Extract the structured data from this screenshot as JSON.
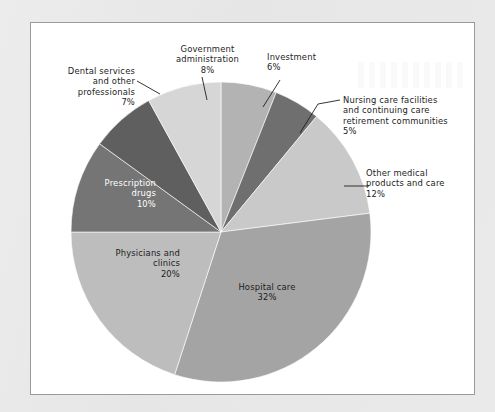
{
  "figure": {
    "panel_background": "#ffffff",
    "panel_border_color": "#9a9a9a",
    "page_background": "#e9e9e9"
  },
  "chart_data": {
    "type": "pie",
    "title": "",
    "subtitle": "",
    "xlabel": "",
    "ylabel": "",
    "legend_position": "none",
    "grid": false,
    "units": "percent",
    "start_angle_deg": 0,
    "direction": "clockwise",
    "center": {
      "x": 221,
      "y": 232
    },
    "radius": 150,
    "categories": [
      "Investment",
      "Nursing care facilities and continuing care retirement communities",
      "Other medical products and care",
      "Hospital care",
      "Physicians and clinics",
      "Prescription drugs",
      "Dental services and other professionals",
      "Government administration"
    ],
    "values": [
      6,
      5,
      12,
      32,
      20,
      10,
      7,
      8
    ],
    "slices": [
      {
        "label": "Investment",
        "value": 6,
        "value_text": "6%",
        "color": "#b3b3b3",
        "label_placement": "outside",
        "label_text": "Investment\n6%"
      },
      {
        "label": "Nursing care facilities and continuing care retirement communities",
        "value": 5,
        "value_text": "5%",
        "color": "#6f6f6f",
        "label_placement": "outside",
        "label_text": "Nursing care facilities\nand continuing care\nretirement communities\n5%"
      },
      {
        "label": "Other medical products and care",
        "value": 12,
        "value_text": "12%",
        "color": "#c9c9c9",
        "label_placement": "outside",
        "label_text": "Other medical\nproducts and care\n12%"
      },
      {
        "label": "Hospital care",
        "value": 32,
        "value_text": "32%",
        "color": "#a4a4a4",
        "label_placement": "inside",
        "label_text": "Hospital care\n32%"
      },
      {
        "label": "Physicians and clinics",
        "value": 20,
        "value_text": "20%",
        "color": "#bdbdbd",
        "label_placement": "inside",
        "label_text": "Physicians and\nclinics\n20%"
      },
      {
        "label": "Prescription drugs",
        "value": 10,
        "value_text": "10%",
        "color": "#757575",
        "label_placement": "inside",
        "label_text": "Prescription\ndrugs\n10%"
      },
      {
        "label": "Dental services and other professionals",
        "value": 7,
        "value_text": "7%",
        "color": "#5f5f5f",
        "label_placement": "outside",
        "label_text": "Dental services\nand other\nprofessionals\n7%"
      },
      {
        "label": "Government administration",
        "value": 8,
        "value_text": "8%",
        "color": "#d6d6d6",
        "label_placement": "outside",
        "label_text": "Government\nadministration\n8%"
      }
    ]
  }
}
